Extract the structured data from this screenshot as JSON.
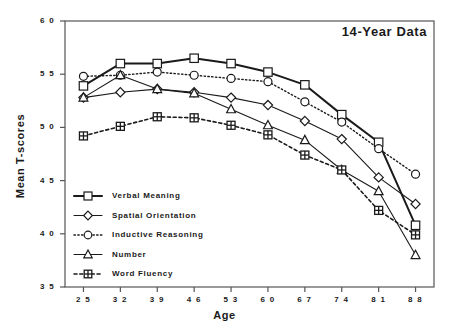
{
  "chart_data": {
    "type": "line",
    "title": "14-Year  Data",
    "xlabel": "Age",
    "ylabel": "Mean T-scores",
    "x": [
      25,
      32,
      39,
      46,
      53,
      60,
      67,
      74,
      81,
      88
    ],
    "xticklabels": [
      "2 5",
      "3 2",
      "3 9",
      "4 6",
      "5 3",
      "6 0",
      "6 7",
      "7 4",
      "8 1",
      "8 8"
    ],
    "yticklabels": [
      "6 0",
      "5 5",
      "5 0",
      "4 5",
      "4 0",
      "3 5"
    ],
    "yticks": [
      60,
      55,
      50,
      45,
      40,
      35
    ],
    "xlim": [
      21.5,
      91.5
    ],
    "ylim": [
      35,
      60
    ],
    "grid": false,
    "legend_position": "lower-left-inside",
    "series": [
      {
        "name": "Verbal  Meaning",
        "marker": "square",
        "linestyle": "solid",
        "linewidth": 2.0,
        "values": [
          53.9,
          56.0,
          56.0,
          56.5,
          56.0,
          55.2,
          54.0,
          51.2,
          48.6,
          40.8
        ]
      },
      {
        "name": "Spatial  Orientation",
        "marker": "diamond",
        "linestyle": "solid",
        "linewidth": 1.1,
        "values": [
          52.8,
          53.3,
          53.6,
          53.3,
          52.8,
          52.1,
          50.6,
          48.9,
          45.3,
          42.8
        ]
      },
      {
        "name": "Inductive  Reasoning",
        "marker": "circle",
        "linestyle": "dotted",
        "linewidth": 1.4,
        "values": [
          54.8,
          54.9,
          55.2,
          54.9,
          54.6,
          54.3,
          52.4,
          50.5,
          48.0,
          45.6
        ]
      },
      {
        "name": "Number",
        "marker": "triangle",
        "linestyle": "solid",
        "linewidth": 1.1,
        "values": [
          52.8,
          54.9,
          53.6,
          53.2,
          51.7,
          50.2,
          48.8,
          46.0,
          44.0,
          38.0
        ]
      },
      {
        "name": "Word  Fluency",
        "marker": "crossed-square",
        "linestyle": "dashed",
        "linewidth": 1.6,
        "values": [
          49.2,
          50.1,
          51.0,
          50.9,
          50.2,
          49.3,
          47.4,
          46.0,
          42.2,
          39.9
        ]
      }
    ]
  },
  "legend": {
    "items": [
      {
        "label": "Verbal  Meaning"
      },
      {
        "label": "Spatial  Orientation"
      },
      {
        "label": "Inductive  Reasoning"
      },
      {
        "label": "Number"
      },
      {
        "label": "Word  Fluency"
      }
    ]
  },
  "colors": {
    "ink": "#1a1a1a",
    "background": "#ffffff",
    "axis": "#555555"
  }
}
